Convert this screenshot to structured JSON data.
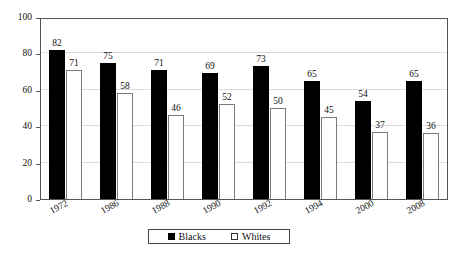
{
  "chart_data": {
    "type": "bar",
    "title": "",
    "xlabel": "",
    "ylabel": "",
    "ylim": [
      0,
      100
    ],
    "yticks": [
      0,
      20,
      40,
      60,
      80,
      100
    ],
    "grid": true,
    "legend_position": "bottom",
    "categories": [
      "1972",
      "1986",
      "1988",
      "1990",
      "1992",
      "1994",
      "2000",
      "2008"
    ],
    "series": [
      {
        "name": "Blacks",
        "color": "#000000",
        "values": [
          82,
          75,
          71,
          69,
          73,
          65,
          54,
          65
        ]
      },
      {
        "name": "Whites",
        "color": "#ffffff",
        "values": [
          71,
          58,
          46,
          52,
          50,
          45,
          37,
          36
        ]
      }
    ]
  },
  "legend": {
    "items": [
      {
        "label": "Blacks",
        "swatch": "filled-square"
      },
      {
        "label": "Whites",
        "swatch": "open-square"
      }
    ]
  },
  "caption": {
    "text": ""
  }
}
